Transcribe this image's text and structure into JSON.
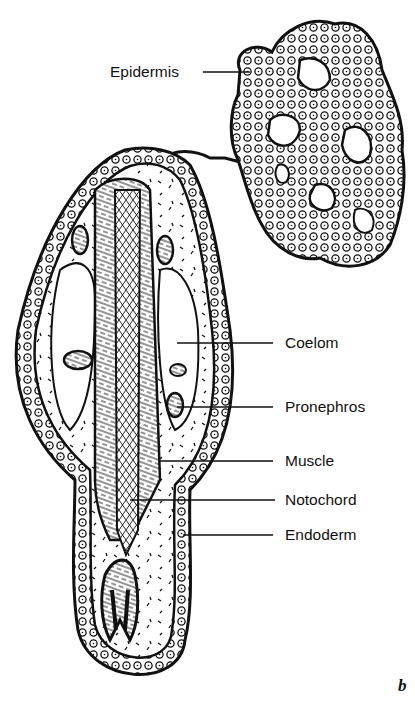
{
  "figure": {
    "panel_letter": "b",
    "labels": {
      "epidermis": "Epidermis",
      "coelom": "Coelom",
      "pronephros": "Pronephros",
      "muscle": "Muscle",
      "notochord": "Notochord",
      "endoderm": "Endoderm"
    },
    "colors": {
      "ink": "#111111",
      "background": "#ffffff"
    }
  }
}
